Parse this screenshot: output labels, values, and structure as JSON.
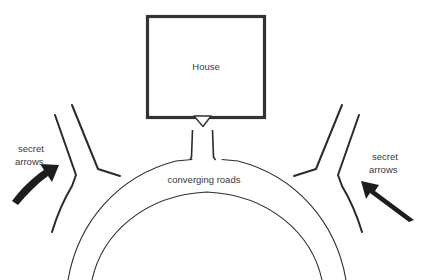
{
  "canvas": {
    "width": 421,
    "height": 280,
    "background": "#ffffff"
  },
  "diagram": {
    "type": "schematic-map",
    "line_color": "#2b2b2b",
    "text_color": "#3a3a3a",
    "arrow_color": "#1d1d1d",
    "house_border_color": "#333333"
  },
  "labels": {
    "house": "House",
    "converging_roads": "converging roads",
    "secret_arrows_left_line1": "secret",
    "secret_arrows_left_line2": "arrows",
    "secret_arrows_right_line1": "secret",
    "secret_arrows_right_line2": "arrows"
  },
  "elements": {
    "house_name": "house-outline",
    "driveway_name": "driveway",
    "main_road_name": "main-curved-road",
    "left_branch_name": "left-branch-road",
    "right_branch_name": "right-branch-road",
    "left_arrow_name": "secret-arrow-left",
    "right_arrow_name": "secret-arrow-right"
  }
}
